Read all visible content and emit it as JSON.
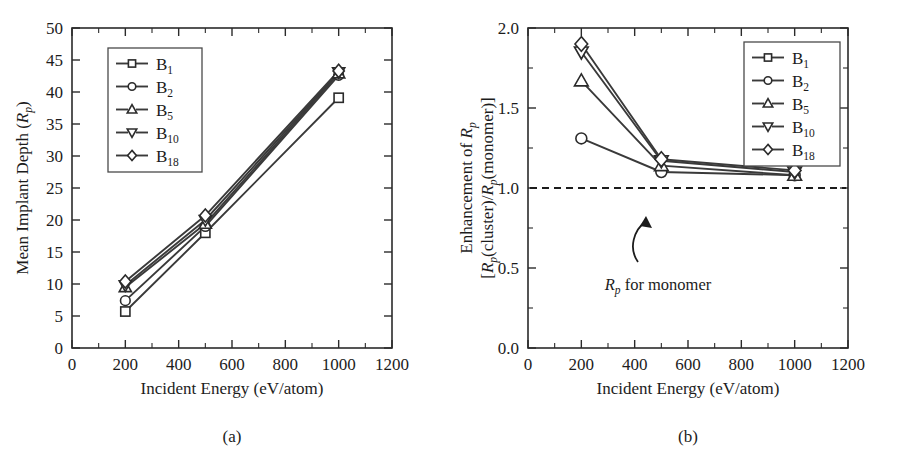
{
  "figure": {
    "panels": [
      {
        "caption": "(a)",
        "xlabel": "Incident Energy (eV/atom)",
        "ylabel_parts": {
          "prefix": "Mean Implant Depth (",
          "symbol": "R",
          "symbol_sub": "p",
          "suffix": ")"
        },
        "xticks": [
          0,
          200,
          400,
          600,
          800,
          1000,
          1200
        ],
        "yticks": [
          0,
          5,
          10,
          15,
          20,
          25,
          30,
          35,
          40,
          45,
          50
        ],
        "legend": [
          "B1",
          "B2",
          "B5",
          "B10",
          "B18"
        ]
      },
      {
        "caption": "(b)",
        "xlabel": "Incident Energy (eV/atom)",
        "ylabel_line1": "Enhancement of Rp",
        "ylabel_line2": "[Rp(cluster)/Rp(monomer)]",
        "xticks": [
          0,
          200,
          400,
          600,
          800,
          1000,
          1200
        ],
        "yticks": [
          "0.0",
          "0.5",
          "1.0",
          "1.5",
          "2.0"
        ],
        "legend": [
          "B1",
          "B2",
          "B5",
          "B10",
          "B18"
        ],
        "annotation": {
          "text": "Rp for monomer",
          "symbol": "R",
          "symbol_sub": "p",
          "rest": " for monomer"
        },
        "reference_line_value": 1.0
      }
    ],
    "legend_entries": [
      {
        "label_base": "B",
        "label_sub": "1",
        "marker": "square"
      },
      {
        "label_base": "B",
        "label_sub": "2",
        "marker": "circle"
      },
      {
        "label_base": "B",
        "label_sub": "5",
        "marker": "triangle-up"
      },
      {
        "label_base": "B",
        "label_sub": "10",
        "marker": "triangle-down"
      },
      {
        "label_base": "B",
        "label_sub": "18",
        "marker": "diamond"
      }
    ]
  },
  "chart_data": [
    {
      "type": "line",
      "panel": "(a)",
      "title": "",
      "xlabel": "Incident Energy (eV/atom)",
      "ylabel": "Mean Implant Depth (Rp)",
      "xlim": [
        0,
        1200
      ],
      "ylim": [
        0,
        50
      ],
      "xticks": [
        0,
        200,
        400,
        600,
        800,
        1000,
        1200
      ],
      "yticks": [
        0,
        5,
        10,
        15,
        20,
        25,
        30,
        35,
        40,
        45,
        50
      ],
      "grid": false,
      "legend_position": "upper-left",
      "x": [
        200,
        500,
        1000
      ],
      "series": [
        {
          "name": "B1",
          "marker": "square",
          "values": [
            5.7,
            18.0,
            39.1
          ]
        },
        {
          "name": "B2",
          "marker": "circle",
          "values": [
            7.4,
            19.0,
            42.6
          ]
        },
        {
          "name": "B5",
          "marker": "triangle-up",
          "values": [
            9.5,
            19.4,
            42.9
          ]
        },
        {
          "name": "B10",
          "marker": "triangle-down",
          "values": [
            9.8,
            20.0,
            43.1
          ]
        },
        {
          "name": "B18",
          "marker": "diamond",
          "values": [
            10.4,
            20.7,
            43.3
          ]
        }
      ]
    },
    {
      "type": "line",
      "panel": "(b)",
      "title": "",
      "xlabel": "Incident Energy (eV/atom)",
      "ylabel": "Enhancement of Rp [Rp(cluster)/Rp(monomer)]",
      "xlim": [
        0,
        1200
      ],
      "ylim": [
        0.0,
        2.0
      ],
      "xticks": [
        0,
        200,
        400,
        600,
        800,
        1000,
        1200
      ],
      "yticks": [
        0.0,
        0.5,
        1.0,
        1.5,
        2.0
      ],
      "grid": false,
      "legend_position": "upper-right",
      "reference_line": {
        "y": 1.0,
        "style": "dashed",
        "label": "Rp for monomer"
      },
      "x": [
        200,
        500,
        1000
      ],
      "series": [
        {
          "name": "B1",
          "marker": "square",
          "values": [
            1.0,
            1.0,
            1.0
          ]
        },
        {
          "name": "B2",
          "marker": "circle",
          "values": [
            1.31,
            1.1,
            1.08
          ]
        },
        {
          "name": "B5",
          "marker": "triangle-up",
          "values": [
            1.67,
            1.14,
            1.08
          ]
        },
        {
          "name": "B10",
          "marker": "triangle-down",
          "values": [
            1.85,
            1.17,
            1.1
          ]
        },
        {
          "name": "B18",
          "marker": "diamond",
          "values": [
            1.9,
            1.18,
            1.11
          ]
        }
      ]
    }
  ]
}
